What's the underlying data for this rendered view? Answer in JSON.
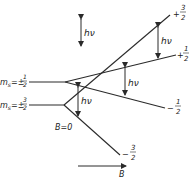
{
  "diagram": {
    "type": "zeeman-splitting",
    "colors": {
      "line": "#2a2a2a",
      "background": "#ffffff"
    },
    "levels": [
      {
        "label_prefix": "m",
        "label_sub": "s",
        "label_value": "=±",
        "num": "1",
        "den": "2"
      },
      {
        "label_prefix": "m",
        "label_sub": "s",
        "label_value": "=±",
        "num": "3",
        "den": "2"
      }
    ],
    "branches": [
      {
        "sign": "+",
        "num": "3",
        "den": "2"
      },
      {
        "sign": "+",
        "num": "1",
        "den": "2"
      },
      {
        "sign": "−",
        "num": "1",
        "den": "2"
      },
      {
        "sign": "−",
        "num": "3",
        "den": "2"
      }
    ],
    "transition_label": "hν",
    "legend_label": "hν",
    "zero_field_label": "B=0",
    "field_axis_label": "B"
  }
}
